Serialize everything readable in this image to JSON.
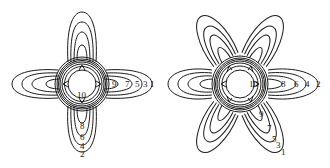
{
  "figures": [
    {
      "id": "left",
      "description": "Four-lobed contour field plot",
      "lobes": 4,
      "labels_horizontal": [
        "10",
        "9",
        "7",
        "5",
        "3",
        "1"
      ],
      "labels_vertical": [
        "8",
        "6",
        "4",
        "2"
      ]
    },
    {
      "id": "right",
      "description": "Six-lobed contour field plot",
      "lobes": 6,
      "labels_horizontal": [
        "10",
        "8",
        "6",
        "4",
        "2"
      ],
      "labels_diagonal": [
        "9",
        "7",
        "5",
        "3",
        "1"
      ]
    }
  ],
  "colors": {
    "line": "#1a1a1a",
    "background": "#ffffff"
  }
}
